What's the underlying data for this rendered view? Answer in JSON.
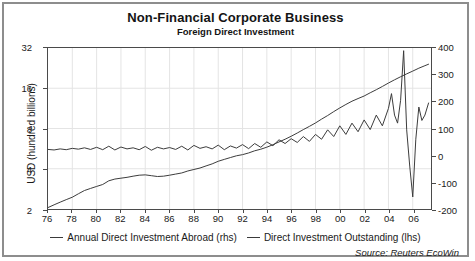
{
  "chart_data": {
    "type": "line",
    "title": "Non-Financial Corporate Business",
    "subtitle": "Foreign Direct Investment",
    "source": "Source: Reuters EcoWin",
    "xlabel": "",
    "grid": true,
    "legend_position": "bottom",
    "x_ticks": [
      "76",
      "78",
      "80",
      "82",
      "84",
      "86",
      "88",
      "90",
      "92",
      "94",
      "96",
      "98",
      "00",
      "02",
      "04",
      "06"
    ],
    "xlim": [
      1976,
      2007.5
    ],
    "left_axis": {
      "label": "USD (hundred billions)",
      "scale": "log",
      "ticks": [
        2,
        4,
        8,
        16,
        32
      ],
      "ylim": [
        2,
        32
      ]
    },
    "right_axis": {
      "label": "USD (billions)",
      "scale": "linear",
      "ticks": [
        -200,
        -100,
        0,
        100,
        200,
        300,
        400
      ],
      "ylim": [
        -200,
        400
      ]
    },
    "series": [
      {
        "name": "Annual Direct Investment Abroad (rhs)",
        "axis": "right",
        "color": "#3a3a3a",
        "x": [
          1976.0,
          1976.5,
          1977.0,
          1977.5,
          1978.0,
          1978.5,
          1979.0,
          1979.5,
          1980.0,
          1980.5,
          1981.0,
          1981.5,
          1982.0,
          1982.5,
          1983.0,
          1983.5,
          1984.0,
          1984.5,
          1985.0,
          1985.5,
          1986.0,
          1986.5,
          1987.0,
          1987.5,
          1988.0,
          1988.5,
          1989.0,
          1989.5,
          1990.0,
          1990.5,
          1991.0,
          1991.5,
          1992.0,
          1992.5,
          1993.0,
          1993.5,
          1994.0,
          1994.5,
          1995.0,
          1995.5,
          1996.0,
          1996.5,
          1997.0,
          1997.5,
          1998.0,
          1998.5,
          1999.0,
          1999.5,
          2000.0,
          2000.5,
          2001.0,
          2001.5,
          2002.0,
          2002.5,
          2003.0,
          2003.5,
          2004.0,
          2004.25,
          2004.5,
          2004.75,
          2005.0,
          2005.25,
          2005.5,
          2005.75,
          2006.0,
          2006.25,
          2006.5,
          2006.75,
          2007.0,
          2007.3
        ],
        "values": [
          22,
          20,
          24,
          21,
          26,
          23,
          28,
          22,
          30,
          21,
          34,
          20,
          31,
          24,
          28,
          21,
          33,
          19,
          30,
          24,
          29,
          22,
          34,
          20,
          37,
          26,
          32,
          24,
          38,
          21,
          35,
          27,
          40,
          25,
          44,
          30,
          50,
          36,
          58,
          44,
          62,
          48,
          70,
          52,
          78,
          60,
          95,
          70,
          110,
          78,
          120,
          88,
          132,
          96,
          150,
          110,
          175,
          230,
          150,
          120,
          205,
          390,
          95,
          -40,
          -155,
          60,
          180,
          130,
          150,
          195
        ],
        "note": "Jagged quarterly/annual flow series oscillating near zero early, spiking to ~390 then plunging to ~-155 around 2005-2006 before recovering near 200"
      },
      {
        "name": "Direct Investment Outstanding (lhs)",
        "axis": "left",
        "color": "#3a3a3a",
        "x": [
          1976.0,
          1976.5,
          1977.0,
          1977.5,
          1978.0,
          1978.5,
          1979.0,
          1979.5,
          1980.0,
          1980.5,
          1981.0,
          1981.5,
          1982.0,
          1982.5,
          1983.0,
          1983.5,
          1984.0,
          1984.5,
          1985.0,
          1985.5,
          1986.0,
          1986.5,
          1987.0,
          1987.5,
          1988.0,
          1988.5,
          1989.0,
          1989.5,
          1990.0,
          1990.5,
          1991.0,
          1991.5,
          1992.0,
          1992.5,
          1993.0,
          1993.5,
          1994.0,
          1994.5,
          1995.0,
          1995.5,
          1996.0,
          1996.5,
          1997.0,
          1997.5,
          1998.0,
          1998.5,
          1999.0,
          1999.5,
          2000.0,
          2000.5,
          2001.0,
          2001.5,
          2002.0,
          2002.5,
          2003.0,
          2003.5,
          2004.0,
          2004.5,
          2005.0,
          2005.5,
          2006.0,
          2006.5,
          2007.0,
          2007.3
        ],
        "values": [
          2.05,
          2.15,
          2.25,
          2.35,
          2.45,
          2.6,
          2.75,
          2.85,
          2.95,
          3.05,
          3.25,
          3.35,
          3.4,
          3.45,
          3.52,
          3.58,
          3.6,
          3.55,
          3.5,
          3.52,
          3.58,
          3.65,
          3.72,
          3.85,
          3.95,
          4.05,
          4.2,
          4.35,
          4.55,
          4.7,
          4.85,
          5.0,
          5.1,
          5.25,
          5.45,
          5.6,
          5.8,
          6.05,
          6.35,
          6.65,
          7.0,
          7.4,
          7.85,
          8.3,
          8.8,
          9.4,
          10.0,
          10.7,
          11.4,
          12.1,
          12.8,
          13.4,
          14.0,
          14.8,
          15.6,
          16.5,
          17.5,
          18.5,
          19.5,
          20.5,
          21.5,
          22.6,
          23.6,
          24.2
        ],
        "note": "Smooth rising stock series on log scale, from ~2 in 1976 to ~24 by 2007"
      }
    ]
  },
  "legend": [
    {
      "label": "Annual Direct Investment Abroad (rhs)"
    },
    {
      "label": "Direct Investment Outstanding (lhs)"
    }
  ]
}
